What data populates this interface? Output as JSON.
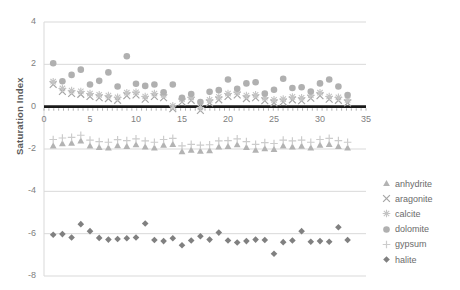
{
  "chart_data": {
    "type": "scatter",
    "title": "",
    "xlabel": "",
    "ylabel": "Saturation Index",
    "xlim": [
      0,
      35
    ],
    "ylim": [
      -8,
      4
    ],
    "xticks": [
      "0",
      "5",
      "10",
      "15",
      "20",
      "25",
      "30",
      "35"
    ],
    "yticks": [
      "4",
      "2",
      "0",
      "-2",
      "-4",
      "-6",
      "-8"
    ],
    "grid": true,
    "legend_position": "right",
    "colors": {
      "anhydrite": "#b3b3b3",
      "aragonite": "#a6a6a6",
      "calcite": "#c4c4c4",
      "dolomite": "#b0b0b0",
      "gypsum": "#cccccc",
      "halite": "#808080",
      "gridline": "#d9d9d9",
      "axis": "#1a1a1a",
      "text": "#808080"
    },
    "x": [
      1,
      2,
      3,
      4,
      5,
      6,
      7,
      8,
      9,
      10,
      11,
      12,
      13,
      14,
      15,
      16,
      17,
      18,
      19,
      20,
      21,
      22,
      23,
      24,
      25,
      26,
      27,
      28,
      29,
      30,
      31,
      32,
      33
    ],
    "series": [
      {
        "name": "anhydrite",
        "marker": "triangle",
        "color": "#b3b3b3",
        "values": [
          -1.85,
          -1.75,
          -1.72,
          -1.62,
          -1.85,
          -1.92,
          -1.95,
          -1.84,
          -1.88,
          -1.8,
          -1.9,
          -1.95,
          -1.82,
          -1.78,
          -2.12,
          -2.05,
          -2.1,
          -2.08,
          -1.9,
          -1.88,
          -1.8,
          -1.92,
          -2.05,
          -1.98,
          -2.02,
          -1.85,
          -1.9,
          -1.86,
          -1.95,
          -1.82,
          -1.78,
          -1.88,
          -1.95
        ]
      },
      {
        "name": "aragonite",
        "marker": "cross",
        "color": "#a6a6a6",
        "values": [
          1.05,
          0.72,
          0.62,
          0.58,
          0.48,
          0.42,
          0.38,
          0.3,
          0.52,
          0.55,
          0.35,
          0.48,
          0.42,
          -0.1,
          0.22,
          0.3,
          -0.18,
          0.18,
          0.32,
          0.48,
          0.55,
          0.38,
          0.42,
          0.28,
          0.18,
          0.22,
          0.32,
          0.28,
          0.4,
          0.52,
          0.35,
          0.3,
          0.18
        ]
      },
      {
        "name": "calcite",
        "marker": "asterisk",
        "color": "#c4c4c4",
        "values": [
          1.18,
          0.86,
          0.76,
          0.72,
          0.62,
          0.56,
          0.52,
          0.44,
          0.66,
          0.68,
          0.48,
          0.62,
          0.56,
          0.04,
          0.36,
          0.44,
          -0.04,
          0.32,
          0.46,
          0.62,
          0.68,
          0.52,
          0.56,
          0.42,
          0.32,
          0.36,
          0.46,
          0.42,
          0.54,
          0.66,
          0.48,
          0.44,
          0.32
        ]
      },
      {
        "name": "dolomite",
        "marker": "circle",
        "color": "#b0b0b0",
        "values": [
          2.05,
          1.2,
          1.5,
          1.75,
          1.05,
          1.22,
          1.62,
          0.95,
          2.38,
          1.08,
          0.98,
          1.05,
          0.68,
          1.05,
          0.42,
          0.6,
          0.22,
          0.7,
          0.78,
          1.28,
          0.85,
          1.1,
          1.15,
          0.62,
          0.8,
          1.32,
          0.88,
          0.92,
          0.72,
          1.1,
          1.28,
          0.95,
          0.55
        ]
      },
      {
        "name": "gypsum",
        "marker": "plus",
        "color": "#cccccc",
        "values": [
          -1.55,
          -1.48,
          -1.45,
          -1.35,
          -1.58,
          -1.65,
          -1.68,
          -1.56,
          -1.6,
          -1.52,
          -1.62,
          -1.68,
          -1.55,
          -1.5,
          -1.85,
          -1.78,
          -1.82,
          -1.8,
          -1.62,
          -1.6,
          -1.52,
          -1.65,
          -1.78,
          -1.7,
          -1.74,
          -1.58,
          -1.62,
          -1.58,
          -1.68,
          -1.55,
          -1.5,
          -1.6,
          -1.68
        ]
      },
      {
        "name": "halite",
        "marker": "diamond",
        "color": "#808080",
        "values": [
          -6.05,
          -6.02,
          -6.18,
          -5.55,
          -5.88,
          -6.2,
          -6.28,
          -6.25,
          -6.22,
          -6.18,
          -5.52,
          -6.3,
          -6.35,
          -6.22,
          -6.55,
          -6.32,
          -6.12,
          -6.28,
          -5.95,
          -6.32,
          -6.42,
          -6.35,
          -6.28,
          -6.3,
          -6.95,
          -6.4,
          -6.32,
          -5.88,
          -6.38,
          -6.35,
          -6.38,
          -5.7,
          -6.3
        ]
      }
    ]
  },
  "legend": {
    "items": [
      {
        "label": "anhydrite"
      },
      {
        "label": "aragonite"
      },
      {
        "label": "calcite"
      },
      {
        "label": "dolomite"
      },
      {
        "label": "gypsum"
      },
      {
        "label": "halite"
      }
    ]
  }
}
